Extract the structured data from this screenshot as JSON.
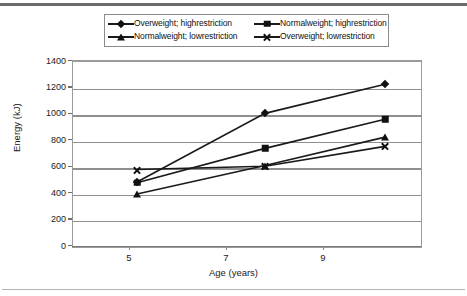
{
  "chart_data": {
    "type": "line",
    "title": "",
    "xlabel": "Age (years)",
    "ylabel": "Energy (kJ)",
    "x": [
      5,
      7,
      9
    ],
    "xtick_labels": [
      "5",
      "7",
      "9"
    ],
    "ytick_labels": [
      "0",
      "200",
      "400",
      "600",
      "800",
      "1000",
      "1200",
      "1400"
    ],
    "yticks": [
      0,
      200,
      400,
      600,
      800,
      1000,
      1200,
      1400
    ],
    "ylim": [
      0,
      1400
    ],
    "grid": "horizontal",
    "legend_position": "top-center",
    "series": [
      {
        "name": "Overweight; highrestriction",
        "marker": "diamond",
        "values": [
          480,
          1000,
          1220
        ]
      },
      {
        "name": "Normalweight; highrestriction",
        "marker": "square",
        "values": [
          475,
          735,
          955
        ]
      },
      {
        "name": "Normalweight; lowrestriction",
        "marker": "triangle",
        "values": [
          390,
          605,
          820
        ]
      },
      {
        "name": "Overweight; lowrestriction",
        "marker": "ex",
        "values": [
          575,
          600,
          750
        ]
      }
    ]
  },
  "legend": {
    "rows": [
      [
        {
          "label": "Overweight; highrestriction",
          "marker": "diamond"
        },
        {
          "label": "Normalweight; highrestriction",
          "marker": "square"
        }
      ],
      [
        {
          "label": "Normalweight; lowrestriction",
          "marker": "triangle"
        },
        {
          "label": "Overweight; lowrestriction",
          "marker": "ex"
        }
      ]
    ]
  },
  "colors": {
    "series_line": "#1a1a1a",
    "gridline": "#8f8f8f",
    "axis": "#7a7a7a",
    "background": "#ffffff"
  }
}
